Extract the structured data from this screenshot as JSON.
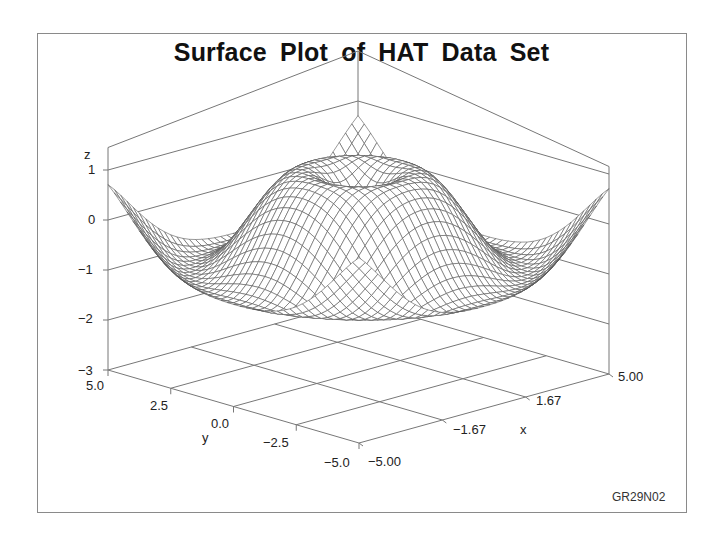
{
  "chart_data": {
    "type": "surface",
    "title": "Surface Plot of HAT Data Set",
    "function": "z = sin(sqrt(x*x + y*y))",
    "x": {
      "label": "x",
      "range": [
        -5,
        5
      ],
      "ticks": [
        "-5.00",
        "-1.67",
        "1.67",
        "5.00"
      ]
    },
    "y": {
      "label": "y",
      "range": [
        -5,
        5
      ],
      "ticks": [
        "5.0",
        "2.5",
        "0.0",
        "-2.5",
        "-5.0"
      ]
    },
    "z": {
      "label": "z",
      "range": [
        -3,
        1
      ],
      "ticks": [
        "1",
        "0",
        "-1",
        "-2",
        "-3"
      ]
    },
    "grid_points": 41,
    "sample_values": [
      {
        "x": 0,
        "y": 0,
        "z": 0.0
      },
      {
        "x": 1.57,
        "y": 0,
        "z": 1.0
      },
      {
        "x": 4.71,
        "y": 0,
        "z": -1.0
      },
      {
        "x": 5,
        "y": 5,
        "z": 0.7
      },
      {
        "x": -5,
        "y": 5,
        "z": 0.7
      },
      {
        "x": 5,
        "y": -5,
        "z": 0.7
      }
    ],
    "footnote": "GR29N02"
  },
  "colors": {
    "mesh": "#555555",
    "axes": "#777777",
    "text": "#222222"
  }
}
